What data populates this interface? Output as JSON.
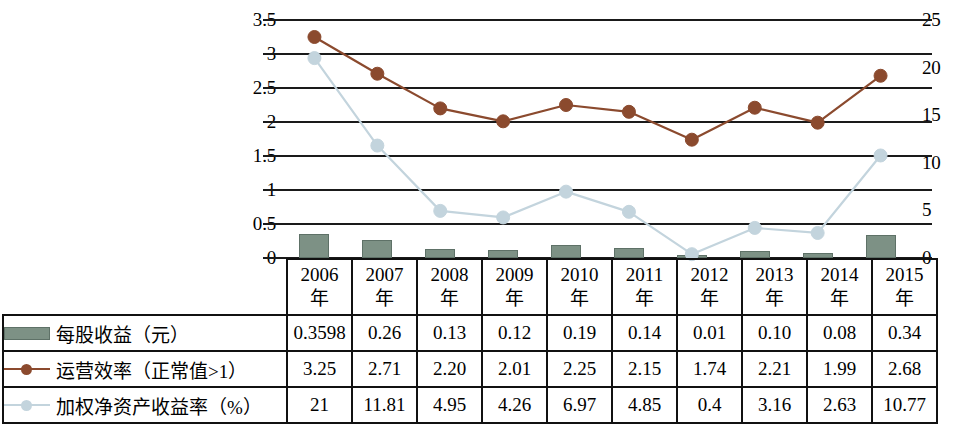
{
  "chart_data": {
    "type": "bar",
    "title": "",
    "xlabel": "",
    "ylabel": "",
    "grid": true,
    "legend_position": "table-rows",
    "categories": [
      "2006年",
      "2007年",
      "2008年",
      "2009年",
      "2010年",
      "2011年",
      "2012年",
      "2013年",
      "2014年",
      "2015年"
    ],
    "category_lines": [
      [
        "2006",
        "年"
      ],
      [
        "2007",
        "年"
      ],
      [
        "2008",
        "年"
      ],
      [
        "2009",
        "年"
      ],
      [
        "2010",
        "年"
      ],
      [
        "2011",
        "年"
      ],
      [
        "2012",
        "年"
      ],
      [
        "2013",
        "年"
      ],
      [
        "2014",
        "年"
      ],
      [
        "2015",
        "年"
      ]
    ],
    "axes": {
      "left": {
        "ylim": [
          0,
          3.5
        ],
        "ticks": [
          "0",
          "0.5",
          "1",
          "1.5",
          "2",
          "2.5",
          "3",
          "3.5"
        ],
        "tick_values": [
          0,
          0.5,
          1,
          1.5,
          2,
          2.5,
          3,
          3.5
        ]
      },
      "right": {
        "ylim": [
          0,
          25
        ],
        "ticks": [
          "0",
          "5",
          "10",
          "15",
          "20",
          "25"
        ],
        "tick_values": [
          0,
          5,
          10,
          15,
          20,
          25
        ]
      }
    },
    "series": [
      {
        "name": "每股收益（元）",
        "type": "bar",
        "axis": "left",
        "color": "#7d9185",
        "marker": "none",
        "values": [
          0.3598,
          0.26,
          0.13,
          0.12,
          0.19,
          0.14,
          0.01,
          0.1,
          0.08,
          0.34
        ],
        "labels": [
          "0.3598",
          "0.26",
          "0.13",
          "0.12",
          "0.19",
          "0.14",
          "0.01",
          "0.10",
          "0.08",
          "0.34"
        ]
      },
      {
        "name": "运营效率（正常值>1）",
        "type": "line",
        "axis": "left",
        "color": "#8b4a2e",
        "marker": "circle",
        "values": [
          3.25,
          2.71,
          2.2,
          2.01,
          2.25,
          2.15,
          1.74,
          2.21,
          1.99,
          2.68
        ],
        "labels": [
          "3.25",
          "2.71",
          "2.20",
          "2.01",
          "2.25",
          "2.15",
          "1.74",
          "2.21",
          "1.99",
          "2.68"
        ]
      },
      {
        "name": "加权净资产收益率（%）",
        "type": "line",
        "axis": "right",
        "color": "#c3d4dd",
        "marker": "circle",
        "values": [
          21,
          11.81,
          4.95,
          4.26,
          6.97,
          4.85,
          0.4,
          3.16,
          2.63,
          10.77
        ],
        "labels": [
          "21",
          "11.81",
          "4.95",
          "4.26",
          "6.97",
          "4.85",
          "0.4",
          "3.16",
          "2.63",
          "10.77"
        ]
      }
    ]
  },
  "table": {
    "corner_label": "",
    "rows": [
      {
        "label": "每股收益（元）",
        "swatch": "bar-swatch",
        "color": "#7d9185"
      },
      {
        "label": "运营效率（正常值>1）",
        "swatch": "line-marker-swatch",
        "color": "#8b4a2e"
      },
      {
        "label": "加权净资产收益率（%）",
        "swatch": "line-marker-swatch",
        "color": "#c3d4dd"
      }
    ]
  }
}
